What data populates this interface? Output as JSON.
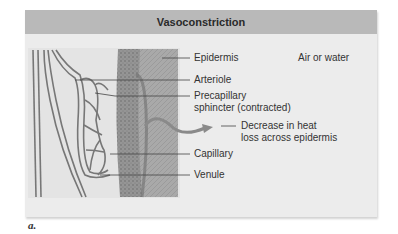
{
  "figure": {
    "title": "Vasoconstriction",
    "sub_label": "a.",
    "labels": {
      "epidermis": "Epidermis",
      "environment": "Air or water",
      "arteriole": "Arteriole",
      "precapillary_line1": "Precapillary",
      "precapillary_line2": "sphincter (contracted)",
      "heat_line1": "Decrease in heat",
      "heat_line2": "loss across epidermis",
      "capillary": "Capillary",
      "venule": "Venule"
    },
    "colors": {
      "header": "#b9b9b9",
      "panel": "#ececec",
      "skin_dark": "#8c8c8c",
      "skin_light": "#a8a8a8",
      "vessel": "#7a7a7a",
      "arrow": "#8a8a8a"
    }
  }
}
